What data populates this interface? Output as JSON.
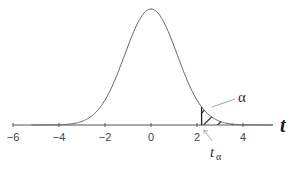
{
  "chart_data": {
    "type": "line",
    "title": "",
    "xlabel": "t",
    "ylabel": "",
    "xlim": [
      -6,
      5
    ],
    "ylim": [
      0,
      0.4
    ],
    "grid": false,
    "legend": null,
    "x_ticks": [
      -6,
      -4,
      -2,
      0,
      2,
      4
    ],
    "tick_labels": [
      "−6",
      "−4",
      "−2",
      "0",
      "2",
      "4"
    ],
    "series": [
      {
        "name": "t-distribution density",
        "curve": "bell",
        "mean": 0,
        "peak_density": 0.4
      }
    ],
    "shaded_region": {
      "from": 2.2,
      "to": 5,
      "style": "hatched",
      "label": "α"
    },
    "annotations": [
      {
        "text": "α",
        "points_to": "upper tail area beyond t_α"
      },
      {
        "text": "t",
        "subscript": "α",
        "x": 2.2,
        "points_to": "critical value on axis"
      }
    ],
    "critical_value": 2.2
  },
  "labels": {
    "axis_var": "t",
    "alpha": "α",
    "t_alpha_main": "t",
    "t_alpha_sub": "α",
    "ticks": [
      "−6",
      "−4",
      "−2",
      "0",
      "2",
      "4"
    ]
  }
}
